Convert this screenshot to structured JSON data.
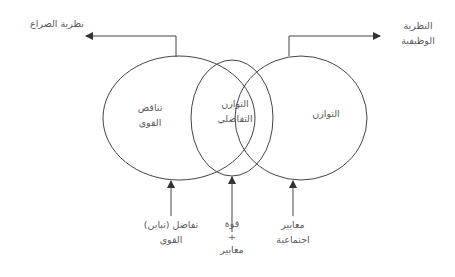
{
  "diagram": {
    "colors": {
      "stroke": "#444444",
      "text": "#5a5a5a",
      "background": "#ffffff"
    },
    "top_labels": {
      "conflict_theory": "نظرية الصراع",
      "functional_theory": [
        "النظرية",
        "الوظيفية"
      ]
    },
    "ellipses": {
      "left": [
        "تناقض",
        "القوى"
      ],
      "middle": [
        "التوازن",
        "التفاضلي"
      ],
      "right": [
        "التوازن"
      ]
    },
    "bottom_labels": {
      "left": [
        "تفاضل (تباين)",
        "القوى"
      ],
      "middle": [
        "قوة",
        "+",
        "معايير"
      ],
      "right": [
        "معايير",
        "اجتماعية"
      ]
    }
  }
}
